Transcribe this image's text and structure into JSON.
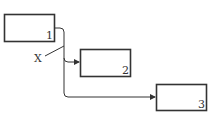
{
  "diagram": {
    "boxes": [
      {
        "id": "1",
        "label": "1"
      },
      {
        "id": "2",
        "label": "2"
      },
      {
        "id": "3",
        "label": "3"
      }
    ],
    "callout": {
      "label": "X"
    },
    "colors": {
      "stroke": "#333333",
      "background": "#ffffff"
    }
  }
}
